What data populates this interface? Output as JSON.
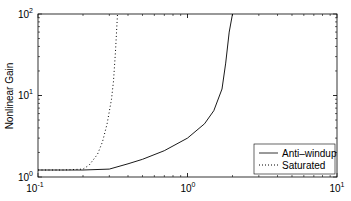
{
  "chart_data": {
    "type": "line",
    "title": "",
    "xlabel": "",
    "ylabel": "Nonlinear Gain",
    "xscale": "log",
    "yscale": "log",
    "xlim": [
      0.1,
      10
    ],
    "ylim": [
      1,
      100
    ],
    "grid": false,
    "legend_position": "lower right",
    "x_ticks": [
      {
        "base": "10",
        "exp": "-1"
      },
      {
        "base": "10",
        "exp": "0"
      },
      {
        "base": "10",
        "exp": "1"
      }
    ],
    "y_ticks": [
      {
        "base": "10",
        "exp": "0"
      },
      {
        "base": "10",
        "exp": "1"
      },
      {
        "base": "10",
        "exp": "2"
      }
    ],
    "series": [
      {
        "name": "Anti–windup",
        "style": "solid",
        "color": "#000000",
        "x": [
          0.1,
          0.2,
          0.3,
          0.4,
          0.5,
          0.7,
          1.0,
          1.3,
          1.5,
          1.7,
          1.8,
          1.9,
          2.0
        ],
        "y": [
          1.22,
          1.22,
          1.25,
          1.45,
          1.65,
          2.1,
          3.0,
          4.5,
          6.5,
          12,
          25,
          60,
          100
        ]
      },
      {
        "name": "Saturated",
        "style": "dotted",
        "color": "#000000",
        "x": [
          0.1,
          0.15,
          0.2,
          0.22,
          0.25,
          0.27,
          0.29,
          0.31,
          0.32,
          0.33,
          0.34
        ],
        "y": [
          1.22,
          1.22,
          1.25,
          1.4,
          1.9,
          2.7,
          4.5,
          9,
          15,
          35,
          100
        ]
      }
    ]
  },
  "legend": {
    "items": [
      {
        "label": "Anti–windup",
        "style": "solid"
      },
      {
        "label": "Saturated",
        "style": "dotted"
      }
    ]
  },
  "axes": {
    "ylabel": "Nonlinear Gain",
    "xtick_labels": [
      {
        "base": "10",
        "exp": "-1"
      },
      {
        "base": "10",
        "exp": "0"
      },
      {
        "base": "10",
        "exp": "1"
      }
    ],
    "ytick_labels": [
      {
        "base": "10",
        "exp": "0"
      },
      {
        "base": "10",
        "exp": "1"
      },
      {
        "base": "10",
        "exp": "2"
      }
    ]
  }
}
